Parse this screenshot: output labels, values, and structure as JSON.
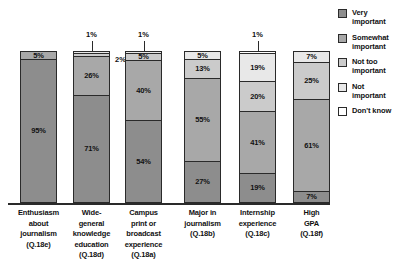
{
  "chart_data": {
    "type": "bar",
    "subtype": "stacked-bar-100-percent",
    "title": "",
    "subtitle": "",
    "xlabel": "",
    "ylabel": "",
    "ylim": [
      0,
      100
    ],
    "grid": false,
    "legend_position": "right",
    "unit": "%",
    "categories": [
      "Enthusiasm about journalism (Q.18e)",
      "Wide-general knowledge education (Q.18d)",
      "Campus print or broadcast experience (Q.18a)",
      "Major in journalism (Q.18b)",
      "Internship experience (Q.18c)",
      "High GPA (Q.18f)"
    ],
    "series": [
      {
        "name": "Very important",
        "color": "#8d8d8d",
        "values": [
          95,
          71,
          54,
          27,
          19,
          7
        ]
      },
      {
        "name": "Somewhat important",
        "color": "#a8a8a8",
        "values": [
          5,
          26,
          40,
          55,
          41,
          61
        ]
      },
      {
        "name": "Not too important",
        "color": "#cbcbcb",
        "values": [
          0,
          2,
          5,
          13,
          20,
          25
        ]
      },
      {
        "name": "Not important",
        "color": "#e8e8e8",
        "values": [
          0,
          1,
          1,
          5,
          19,
          7
        ]
      },
      {
        "name": "Don't know",
        "color": "#ffffff",
        "values": [
          0,
          0,
          0,
          0,
          1,
          0
        ]
      }
    ]
  },
  "legend": {
    "items": [
      {
        "label_line1": "Very",
        "label_line2": "important"
      },
      {
        "label_line1": "Somewhat",
        "label_line2": "important"
      },
      {
        "label_line1": "Not too",
        "label_line2": "important"
      },
      {
        "label_line1": "Not",
        "label_line2": "important"
      },
      {
        "label_line1": "Don't know",
        "label_line2": ""
      }
    ]
  },
  "bars": [
    {
      "label_lines": [
        "Enthusiasm",
        "about",
        "journalism",
        "(Q.18e)"
      ],
      "segments": [
        {
          "series": "Very important",
          "value": 95,
          "text": "95%",
          "placement": "inside"
        },
        {
          "series": "Somewhat important",
          "value": 5,
          "text": "5%",
          "placement": "inside"
        }
      ]
    },
    {
      "label_lines": [
        "Wide-",
        "general",
        "knowledge",
        "education",
        "(Q.18d)"
      ],
      "segments": [
        {
          "series": "Very important",
          "value": 71,
          "text": "71%",
          "placement": "inside"
        },
        {
          "series": "Somewhat important",
          "value": 26,
          "text": "26%",
          "placement": "inside"
        },
        {
          "series": "Not too important",
          "value": 2,
          "text": "2%",
          "placement": "right"
        },
        {
          "series": "Not important",
          "value": 1,
          "text": "1%",
          "placement": "above"
        }
      ]
    },
    {
      "label_lines": [
        "Campus",
        "print or",
        "broadcast",
        "experience",
        "(Q.18a)"
      ],
      "segments": [
        {
          "series": "Very important",
          "value": 54,
          "text": "54%",
          "placement": "inside"
        },
        {
          "series": "Somewhat important",
          "value": 40,
          "text": "40%",
          "placement": "inside"
        },
        {
          "series": "Not too important",
          "value": 5,
          "text": "5%",
          "placement": "inside"
        },
        {
          "series": "Not important",
          "value": 1,
          "text": "1%",
          "placement": "above"
        }
      ]
    },
    {
      "label_lines": [
        "Major in",
        "journalism",
        "(Q.18b)"
      ],
      "segments": [
        {
          "series": "Very important",
          "value": 27,
          "text": "27%",
          "placement": "inside"
        },
        {
          "series": "Somewhat important",
          "value": 55,
          "text": "55%",
          "placement": "inside"
        },
        {
          "series": "Not too important",
          "value": 13,
          "text": "13%",
          "placement": "inside"
        },
        {
          "series": "Not important",
          "value": 5,
          "text": "5%",
          "placement": "inside"
        }
      ]
    },
    {
      "label_lines": [
        "Internship",
        "experience",
        "(Q.18c)"
      ],
      "segments": [
        {
          "series": "Very important",
          "value": 19,
          "text": "19%",
          "placement": "inside"
        },
        {
          "series": "Somewhat important",
          "value": 41,
          "text": "41%",
          "placement": "inside"
        },
        {
          "series": "Not too important",
          "value": 20,
          "text": "20%",
          "placement": "inside"
        },
        {
          "series": "Not important",
          "value": 19,
          "text": "19%",
          "placement": "inside"
        },
        {
          "series": "Don't know",
          "value": 1,
          "text": "1%",
          "placement": "above"
        }
      ]
    },
    {
      "label_lines": [
        "High",
        "GPA",
        "(Q.18f)"
      ],
      "segments": [
        {
          "series": "Very important",
          "value": 7,
          "text": "7%",
          "placement": "inside"
        },
        {
          "series": "Somewhat important",
          "value": 61,
          "text": "61%",
          "placement": "inside"
        },
        {
          "series": "Not too important",
          "value": 25,
          "text": "25%",
          "placement": "inside"
        },
        {
          "series": "Not important",
          "value": 7,
          "text": "7%",
          "placement": "inside"
        }
      ]
    }
  ]
}
